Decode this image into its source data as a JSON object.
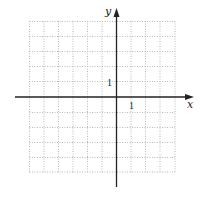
{
  "graph": {
    "x_axis_label": "x",
    "y_axis_label": "y",
    "x_tick_label": "1",
    "y_tick_label": "1",
    "grid": {
      "columns": 10,
      "rows": 10,
      "x_range": [
        -6,
        4
      ],
      "y_range": [
        -5,
        5
      ],
      "line_style": "dotted",
      "line_color": "#b8b8b8"
    },
    "axis_color": "#222222"
  }
}
